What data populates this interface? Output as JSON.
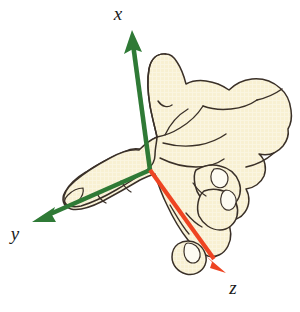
{
  "figure": {
    "background_color": "#ffffff"
  },
  "axes": {
    "origin": {
      "x": 150,
      "y": 170
    },
    "items": [
      {
        "id": "x",
        "label": "x",
        "color": "#2f7a36",
        "label_position": {
          "x": 118,
          "y": 20
        },
        "tip": {
          "x": 133,
          "y": 31
        },
        "direction": "up",
        "body_part": "thumb"
      },
      {
        "id": "y",
        "label": "y",
        "color": "#2f7a36",
        "label_position": {
          "x": 12,
          "y": 240
        },
        "tip": {
          "x": 32,
          "y": 222
        },
        "direction": "down-left",
        "body_part": "index-finger"
      },
      {
        "id": "z",
        "label": "z",
        "color": "#ee4422",
        "label_position": {
          "x": 231,
          "y": 294
        },
        "tip": {
          "x": 226,
          "y": 273
        },
        "direction": "down-right",
        "body_part": "curled-fingers"
      }
    ]
  },
  "hand": {
    "fill_color": "#f8f0d2",
    "outline_color": "#3a3028",
    "nail_fill_color": "#fdfbf2",
    "parts": [
      "thumb",
      "index-finger",
      "middle-finger",
      "ring-finger",
      "pinky-finger",
      "palm",
      "back-of-hand",
      "wrist"
    ]
  },
  "colors": {
    "green_axis": "#2f7a36",
    "red_axis": "#ee4422",
    "hand_fill": "#f8f0d2",
    "outline": "#3a3028",
    "label_text": "#1a1a1a",
    "background": "#ffffff"
  }
}
